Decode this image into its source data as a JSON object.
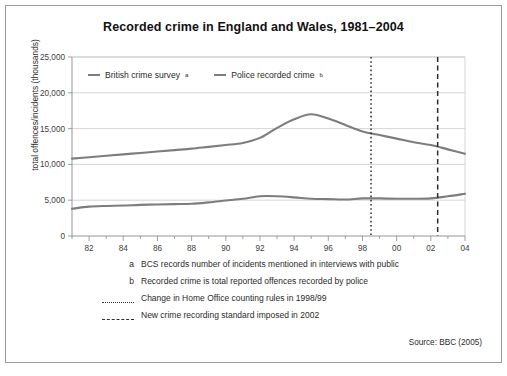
{
  "figure": {
    "title": "Recorded crime in England and Wales, 1981–2004",
    "source": "Source: BBC (2005)"
  },
  "legend": {
    "items": [
      {
        "label": "British crime survey",
        "marker": "a",
        "color": "#7d7d7d"
      },
      {
        "label": "Police recorded crime",
        "marker": "b",
        "color": "#7d7d7d"
      }
    ]
  },
  "notes": [
    {
      "marker": "a",
      "marker_type": "letter",
      "text": "BCS records number of incidents mentioned in interviews with public"
    },
    {
      "marker": "b",
      "marker_type": "letter",
      "text": "Recorded crime is total reported offences recorded by police"
    },
    {
      "marker": "",
      "marker_type": "dotted",
      "text": "Change in Home Office counting rules in 1998/99"
    },
    {
      "marker": "",
      "marker_type": "dashed",
      "text": "New crime recording standard imposed in 2002"
    }
  ],
  "chart_data": {
    "type": "line",
    "title": "Recorded crime in England and Wales, 1981–2004",
    "xlabel": "",
    "ylabel": "total offences/incidents (thousands)",
    "ylim": [
      0,
      25000
    ],
    "xlim": [
      1981,
      2004
    ],
    "grid": true,
    "legend_position": "top-left-inside",
    "ytick_labels": [
      "0",
      "5,000",
      "10,000",
      "15,000",
      "20,000",
      "25,000"
    ],
    "ytick_values": [
      0,
      5000,
      10000,
      15000,
      20000,
      25000
    ],
    "xtick_labels": [
      "82",
      "84",
      "86",
      "88",
      "90",
      "92",
      "94",
      "96",
      "98",
      "00",
      "02",
      "04"
    ],
    "xtick_values": [
      1982,
      1984,
      1986,
      1988,
      1990,
      1992,
      1994,
      1996,
      1998,
      2000,
      2002,
      2004
    ],
    "x": [
      1981,
      1982,
      1983,
      1984,
      1985,
      1986,
      1987,
      1988,
      1989,
      1990,
      1991,
      1992,
      1993,
      1994,
      1995,
      1996,
      1997,
      1998,
      1999,
      2000,
      2001,
      2002,
      2003,
      2004
    ],
    "series": [
      {
        "name": "British crime survey",
        "color": "#7d7d7d",
        "values": [
          10800,
          11000,
          11200,
          11400,
          11600,
          11800,
          12000,
          12200,
          12450,
          12700,
          13000,
          13700,
          15100,
          16300,
          17000,
          16400,
          15500,
          14600,
          14100,
          13600,
          13100,
          12700,
          12100,
          11500
        ]
      },
      {
        "name": "Police recorded crime",
        "color": "#7d7d7d",
        "values": [
          3800,
          4100,
          4200,
          4250,
          4350,
          4400,
          4450,
          4500,
          4700,
          4950,
          5200,
          5550,
          5550,
          5400,
          5200,
          5150,
          5100,
          5250,
          5250,
          5200,
          5200,
          5250,
          5550,
          5900
        ]
      }
    ],
    "annotations": [
      {
        "type": "vline",
        "x": 1998.5,
        "style": "dotted",
        "label": "Change in Home Office counting rules in 1998/99"
      },
      {
        "type": "vline",
        "x": 2002.4,
        "style": "dashed",
        "label": "New crime recording standard imposed in 2002"
      }
    ]
  }
}
